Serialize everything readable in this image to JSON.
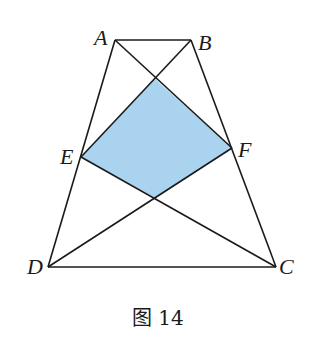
{
  "figure": {
    "caption": "图 14",
    "fill_color": "#a9d3ef",
    "stroke_color": "#1a1a1a",
    "points": {
      "A": {
        "label": "A",
        "x": 115,
        "y": 40
      },
      "B": {
        "label": "B",
        "x": 191,
        "y": 40
      },
      "C": {
        "label": "C",
        "x": 276,
        "y": 267
      },
      "D": {
        "label": "D",
        "x": 48,
        "y": 267
      },
      "E": {
        "label": "E",
        "x": 81,
        "y": 157
      },
      "F": {
        "label": "F",
        "x": 232,
        "y": 148
      }
    },
    "shaded_region": "quadrilateral formed by E, F and intersections of AC/BE and BD/CE"
  }
}
